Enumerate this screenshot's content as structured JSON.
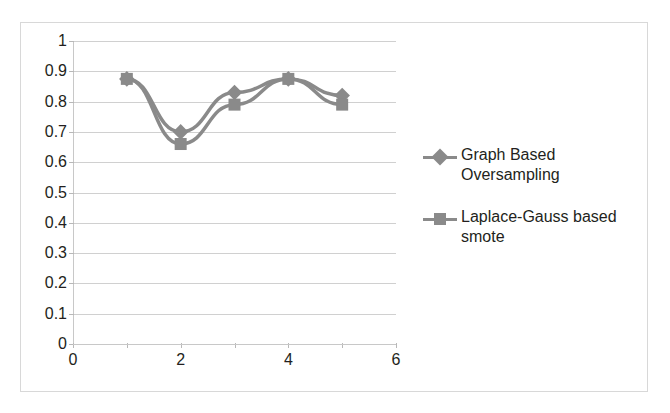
{
  "chart_data": {
    "type": "line",
    "title": "",
    "xlabel": "",
    "ylabel": "",
    "xlim": [
      0,
      6
    ],
    "ylim": [
      0,
      1
    ],
    "x": [
      1,
      2,
      3,
      4,
      5
    ],
    "xticks": [
      0,
      1,
      2,
      3,
      4,
      5,
      6
    ],
    "xtick_labels": [
      "0",
      "",
      "2",
      "",
      "4",
      "",
      "6"
    ],
    "yticks": [
      0,
      0.1,
      0.2,
      0.3,
      0.4,
      0.5,
      0.6,
      0.7,
      0.8,
      0.9,
      1
    ],
    "ytick_labels": [
      "0",
      "0.1",
      "0.2",
      "0.3",
      "0.4",
      "0.5",
      "0.6",
      "0.7",
      "0.8",
      "0.9",
      "1"
    ],
    "grid": "horizontal",
    "legend_position": "right",
    "series": [
      {
        "name": "Graph Based Oversampling",
        "marker": "diamond",
        "color": "#8a8a8a",
        "values": [
          0.875,
          0.7,
          0.83,
          0.875,
          0.82
        ]
      },
      {
        "name": "Laplace-Gauss based smote",
        "marker": "square",
        "color": "#8a8a8a",
        "values": [
          0.875,
          0.66,
          0.79,
          0.875,
          0.79
        ]
      }
    ]
  },
  "legend": {
    "entries": [
      {
        "label": "Graph Based Oversampling",
        "marker": "diamond-marker-icon"
      },
      {
        "label": "Laplace-Gauss based smote",
        "marker": "square-marker-icon"
      }
    ]
  },
  "colors": {
    "series_gray": "#8a8a8a",
    "gridline": "#d0d0d0",
    "axis": "#c8c8c8",
    "text": "#231f20",
    "border": "#d8d8d8",
    "background": "#ffffff"
  }
}
